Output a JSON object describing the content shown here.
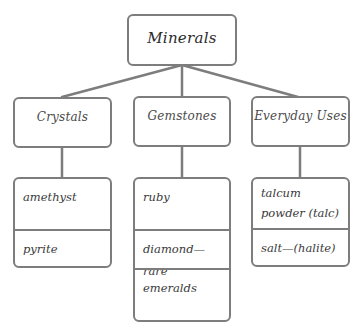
{
  "diagram": {
    "title": "Minerals",
    "stroke_color": "#7d7d7d",
    "categories": [
      {
        "label": "Crystals",
        "items": [
          "amethyst",
          "pyrite"
        ]
      },
      {
        "label": "Gemstones",
        "items": [
          "ruby",
          "diamond—rare",
          "emeralds"
        ]
      },
      {
        "label": "Everyday Uses",
        "items": [
          "talcum powder (talc)",
          "salt—(halite)"
        ]
      }
    ]
  }
}
